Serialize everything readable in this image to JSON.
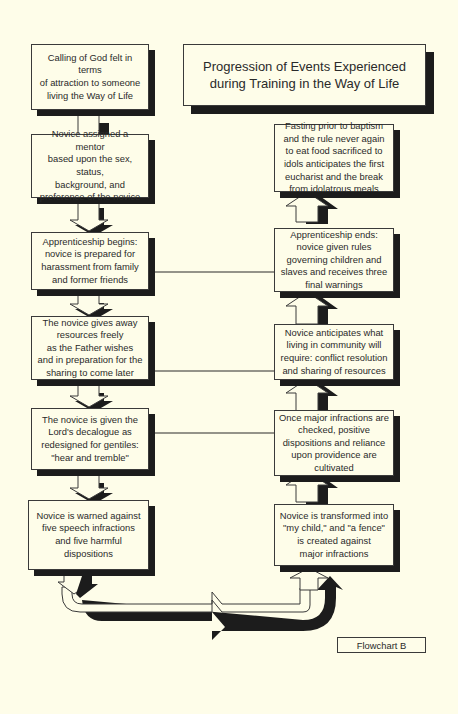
{
  "diagram": {
    "title": "Progression of Events Experienced\nduring Training in the Way of Life",
    "label": "Flowchart B",
    "left_column": [
      {
        "id": "L1",
        "text": "Calling of God felt in terms\nof attraction to someone\nliving the Way of Life"
      },
      {
        "id": "L2",
        "text": "Novice assigned a mentor\nbased upon the sex, status,\nbackground, and\npreference of the novice"
      },
      {
        "id": "L3",
        "text": "Apprenticeship begins:\nnovice is prepared for\nharassment from family\nand former friends"
      },
      {
        "id": "L4",
        "text": "The novice gives away\nresources freely\nas the Father wishes\nand in preparation for the\nsharing to come later"
      },
      {
        "id": "L5",
        "text": "The novice is given the\nLord's decalogue as\nredesigned for gentiles:\n\"hear and tremble\""
      },
      {
        "id": "L6",
        "text": "Novice is warned against\nfive speech infractions\nand five harmful\ndispositions"
      }
    ],
    "right_column": [
      {
        "id": "R1",
        "text": "Fasting prior to baptism\nand the rule never again\nto eat food sacrificed to\nidols anticipates the first\neucharist and the break\nfrom idolatrous meals"
      },
      {
        "id": "R2",
        "text": "Apprenticeship ends:\nnovice given rules\ngoverning children and\nslaves and receives three\nfinal warnings"
      },
      {
        "id": "R3",
        "text": "Novice anticipates what\nliving in community will\nrequire: conflict resolution\nand sharing of resources"
      },
      {
        "id": "R4",
        "text": "Once major infractions are\nchecked, positive\ndispositions and reliance\nupon providence are\ncultivated"
      },
      {
        "id": "R5",
        "text": "Novice is transformed into\n\"my child,\" and \"a fence\"\nis created against\nmajor infractions"
      }
    ],
    "connections": [
      {
        "from": "L1",
        "to": "L2",
        "type": "down-arrow"
      },
      {
        "from": "L2",
        "to": "L3",
        "type": "down-arrow"
      },
      {
        "from": "L3",
        "to": "L4",
        "type": "down-arrow"
      },
      {
        "from": "L4",
        "to": "L5",
        "type": "down-arrow"
      },
      {
        "from": "L5",
        "to": "L6",
        "type": "down-arrow"
      },
      {
        "from": "L6",
        "to": "R5",
        "type": "u-turn-arrow"
      },
      {
        "from": "R5",
        "to": "R4",
        "type": "up-arrow"
      },
      {
        "from": "R4",
        "to": "R3",
        "type": "up-arrow"
      },
      {
        "from": "R3",
        "to": "R2",
        "type": "up-arrow"
      },
      {
        "from": "R2",
        "to": "R1",
        "type": "up-arrow"
      },
      {
        "from": "L3",
        "to": "R2",
        "type": "line-arrow"
      },
      {
        "from": "L4",
        "to": "R3",
        "type": "line-arrow"
      },
      {
        "from": "L5",
        "to": "R4",
        "type": "line-arrow"
      }
    ]
  }
}
